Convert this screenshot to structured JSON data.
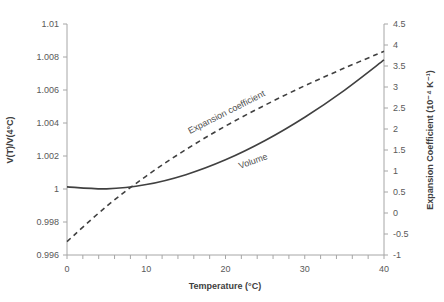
{
  "chart_data": {
    "type": "line",
    "title": "",
    "xlabel": "Temperature (°C)",
    "ylabel": "V(T)/V(4°C)",
    "y2label": "Expansion Coefficient (10⁻⁴ K⁻¹)",
    "xlim": [
      0,
      40
    ],
    "ylim": [
      0.996,
      1.01
    ],
    "y2lim": [
      -1,
      4.5
    ],
    "grid": false,
    "legend": "inline labels",
    "x_ticks": [
      "0",
      "10",
      "20",
      "30",
      "40"
    ],
    "y_ticks": [
      "0.996",
      "0.998",
      "1",
      "1.002",
      "1.004",
      "1.006",
      "1.008",
      "1.01"
    ],
    "y2_ticks": [
      "-1",
      "-0.5",
      "0",
      "0.5",
      "1",
      "1.5",
      "2",
      "2.5",
      "3",
      "3.5",
      "4",
      "4.5"
    ],
    "x": [
      0,
      5,
      10,
      15,
      20,
      25,
      30,
      35,
      40
    ],
    "series": [
      {
        "name": "Volume",
        "axis": "left",
        "style": "solid",
        "color": "#404040",
        "values": [
          1.00013,
          1.00001,
          1.00027,
          1.00087,
          1.00177,
          1.00294,
          1.00435,
          1.00598,
          1.00782
        ]
      },
      {
        "name": "Expansion coefficient",
        "axis": "right",
        "style": "dashed",
        "color": "#404040",
        "values": [
          -0.68,
          0.16,
          0.88,
          1.51,
          2.07,
          2.57,
          3.03,
          3.45,
          3.85
        ]
      }
    ],
    "annotations": [
      "Expansion coefficient",
      "Volume"
    ]
  }
}
